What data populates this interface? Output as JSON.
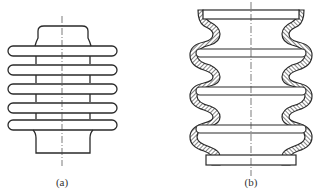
{
  "figure": {
    "panels": [
      {
        "id": "a",
        "label": "(a)",
        "description": "Cylinder with stacked stadium-shaped rings (outer-ring bellows)"
      },
      {
        "id": "b",
        "label": "(b)",
        "description": "Convoluted rubber bellows with reinforcing cords and internal plates"
      }
    ],
    "colors": {
      "line": "#2a2a2a",
      "background": "#ffffff",
      "centerline": "#444444"
    }
  }
}
